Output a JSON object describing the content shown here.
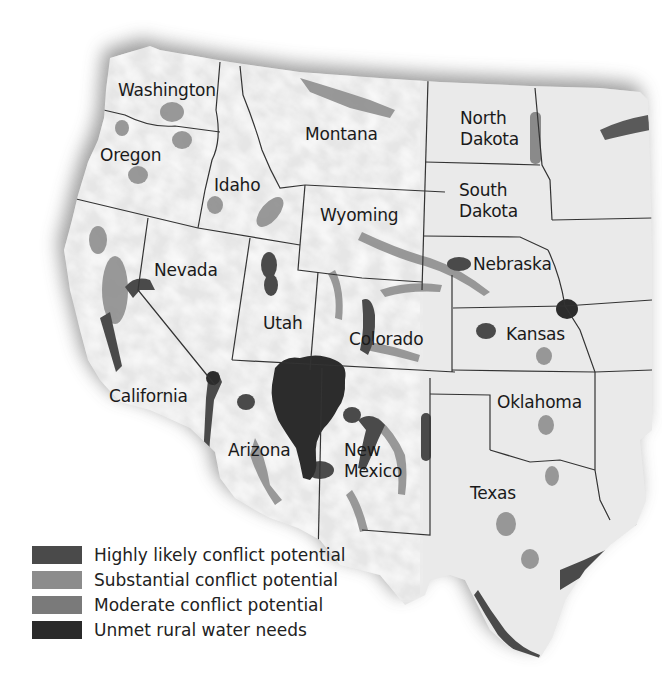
{
  "map": {
    "region": "Western United States",
    "state_labels": [
      {
        "id": "washington",
        "text": "Washington",
        "x": 118,
        "y": 80
      },
      {
        "id": "oregon",
        "text": "Oregon",
        "x": 100,
        "y": 145
      },
      {
        "id": "idaho",
        "text": "Idaho",
        "x": 214,
        "y": 175
      },
      {
        "id": "montana",
        "text": "Montana",
        "x": 305,
        "y": 124
      },
      {
        "id": "wyoming",
        "text": "Wyoming",
        "x": 320,
        "y": 205
      },
      {
        "id": "north-dakota",
        "text": "North\nDakota",
        "x": 460,
        "y": 108
      },
      {
        "id": "south-dakota",
        "text": "South\nDakota",
        "x": 459,
        "y": 180
      },
      {
        "id": "nebraska",
        "text": "Nebraska",
        "x": 473,
        "y": 254
      },
      {
        "id": "kansas",
        "text": "Kansas",
        "x": 506,
        "y": 324
      },
      {
        "id": "nevada",
        "text": "Nevada",
        "x": 154,
        "y": 260
      },
      {
        "id": "utah",
        "text": "Utah",
        "x": 263,
        "y": 313
      },
      {
        "id": "colorado",
        "text": "Colorado",
        "x": 349,
        "y": 329
      },
      {
        "id": "california",
        "text": "California",
        "x": 109,
        "y": 386
      },
      {
        "id": "oklahoma",
        "text": "Oklahoma",
        "x": 497,
        "y": 392
      },
      {
        "id": "arizona",
        "text": "Arizona",
        "x": 228,
        "y": 440
      },
      {
        "id": "new-mexico",
        "text": "New\nMexico",
        "x": 344,
        "y": 440
      },
      {
        "id": "texas",
        "text": "Texas",
        "x": 470,
        "y": 483
      }
    ]
  },
  "legend": {
    "items": [
      {
        "label": "Highly likely conflict potential",
        "color": "#4a4a4a"
      },
      {
        "label": "Substantial conflict potential",
        "color": "#8c8c8c"
      },
      {
        "label": "Moderate conflict potential",
        "color": "#7a7a7a"
      },
      {
        "label": "Unmet rural water needs",
        "color": "#2a2a2a"
      }
    ]
  },
  "colors": {
    "land": "#e8e8e8",
    "land_highlight": "#f6f6f6",
    "border": "#3a3a3a",
    "shadow": "#9a9a9a",
    "highly_likely": "#4a4a4a",
    "substantial": "#8c8c8c",
    "moderate": "#7a7a7a",
    "unmet": "#2a2a2a"
  }
}
